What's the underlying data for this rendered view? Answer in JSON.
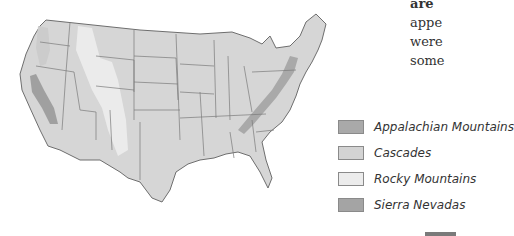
{
  "side_text": {
    "lines": [
      "are ",
      "appe",
      "were ",
      "some"
    ]
  },
  "map": {
    "title": "United States mountain ranges",
    "colors": {
      "land": "#d6d6d6",
      "border": "#6e6e6e",
      "appalachian": "#a9a9a9",
      "cascades": "#cfcfcf",
      "rocky": "#e8e8e8",
      "sierra": "#a0a0a0"
    }
  },
  "legend": {
    "items": [
      {
        "label": "Appalachian Mountains",
        "color": "#a9a9a9"
      },
      {
        "label": "Cascades",
        "color": "#d3d3d3"
      },
      {
        "label": "Rocky Mountains",
        "color": "#ececec"
      },
      {
        "label": "Sierra Nevadas",
        "color": "#a4a4a4"
      }
    ]
  }
}
